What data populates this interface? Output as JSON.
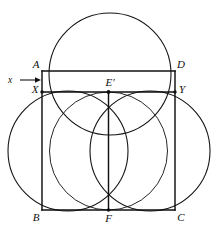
{
  "figure": {
    "background_color": "#ffffff",
    "stroke_color": "#101010",
    "width": 220,
    "height": 231
  },
  "labels": {
    "a": "A",
    "d": "D",
    "x_point": "X",
    "y_point": "Y",
    "e_prime": "E'",
    "b": "B",
    "c": "C",
    "f": "F",
    "x_measure": "x"
  },
  "points": {
    "A": {
      "x": 42,
      "y": 71
    },
    "D": {
      "x": 175,
      "y": 71
    },
    "X": {
      "x": 42,
      "y": 92
    },
    "Y": {
      "x": 175,
      "y": 92
    },
    "E_prime": {
      "x": 108.5,
      "y": 92
    },
    "B": {
      "x": 42,
      "y": 210
    },
    "C": {
      "x": 175,
      "y": 210
    },
    "F": {
      "x": 108.5,
      "y": 210
    }
  },
  "circles": [
    {
      "name": "top-circle",
      "cx": 110,
      "cy": 74,
      "r": 61
    },
    {
      "name": "left-circle",
      "cx": 68,
      "cy": 151,
      "r": 60
    },
    {
      "name": "right-circle",
      "cx": 150,
      "cy": 151,
      "r": 60
    },
    {
      "name": "center-circle",
      "cx": 108.5,
      "cy": 151,
      "r": 59
    }
  ],
  "segments": [
    {
      "name": "segment-AD",
      "x1": 42,
      "y1": 71,
      "x2": 175,
      "y2": 71
    },
    {
      "name": "segment-XY",
      "x1": 42,
      "y1": 92,
      "x2": 175,
      "y2": 92
    },
    {
      "name": "segment-BC",
      "x1": 42,
      "y1": 210,
      "x2": 175,
      "y2": 210
    },
    {
      "name": "segment-AB",
      "x1": 42,
      "y1": 71,
      "x2": 42,
      "y2": 210
    },
    {
      "name": "segment-DC",
      "x1": 175,
      "y1": 71,
      "x2": 175,
      "y2": 210
    },
    {
      "name": "segment-EF",
      "x1": 108.5,
      "y1": 92,
      "x2": 108.5,
      "y2": 210
    }
  ],
  "annotation": {
    "arrow_label": "x",
    "arrow_from_x": 20,
    "arrow_to_x": 41,
    "arrow_y": 80
  }
}
